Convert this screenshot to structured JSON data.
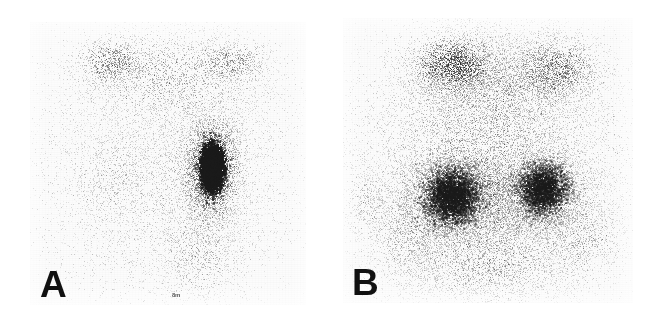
{
  "figure": {
    "kind": "scintigraphy-image-pair",
    "width": 662,
    "height": 320,
    "background_color": "#ffffff",
    "dot_color": "#1a1a1a"
  },
  "panels": [
    {
      "label": "A",
      "label_x": 40,
      "label_y": 266,
      "frame": {
        "x": 30,
        "y": 22,
        "w": 276,
        "h": 283
      },
      "base_tint": "#fcfcfc",
      "description": "Anterior scintigram with a single focal intense vertically elongated hot spot just right of midline and faint diffuse background uptake",
      "marker_text": "8m",
      "marker_x": 172,
      "marker_y": 292,
      "noise": {
        "background_count": 5200,
        "background_opacity": 0.16,
        "seed": 17
      },
      "blobs": [
        {
          "name": "focal-hot-spot-core",
          "cx": 212,
          "cy": 168,
          "rx": 16,
          "ry": 33,
          "count": 5200,
          "opacity": 0.82,
          "dot": 1.25,
          "sigma": 0.55
        },
        {
          "name": "focal-hot-spot-halo",
          "cx": 211,
          "cy": 168,
          "rx": 30,
          "ry": 54,
          "count": 2600,
          "opacity": 0.36,
          "dot": 1.1,
          "sigma": 0.75
        },
        {
          "name": "focal-hot-spot-outer",
          "cx": 211,
          "cy": 170,
          "rx": 46,
          "ry": 76,
          "count": 1500,
          "opacity": 0.18,
          "dot": 1.0,
          "sigma": 0.9
        },
        {
          "name": "upper-dome-diffuse",
          "cx": 172,
          "cy": 78,
          "rx": 92,
          "ry": 46,
          "count": 2200,
          "opacity": 0.2,
          "dot": 1.0,
          "sigma": 1.0
        },
        {
          "name": "upper-left-shoulder",
          "cx": 112,
          "cy": 62,
          "rx": 34,
          "ry": 22,
          "count": 700,
          "opacity": 0.28,
          "dot": 1.0,
          "sigma": 0.9
        },
        {
          "name": "upper-right-shoulder",
          "cx": 232,
          "cy": 62,
          "rx": 36,
          "ry": 22,
          "count": 620,
          "opacity": 0.24,
          "dot": 1.0,
          "sigma": 0.9
        },
        {
          "name": "body-soft-tissue",
          "cx": 170,
          "cy": 180,
          "rx": 110,
          "ry": 112,
          "count": 3400,
          "opacity": 0.13,
          "dot": 1.0,
          "sigma": 1.0
        },
        {
          "name": "lower-midline-trail",
          "cx": 200,
          "cy": 252,
          "rx": 40,
          "ry": 48,
          "count": 900,
          "opacity": 0.17,
          "dot": 1.0,
          "sigma": 0.95
        },
        {
          "name": "left-flank-faint",
          "cx": 110,
          "cy": 175,
          "rx": 42,
          "ry": 60,
          "count": 800,
          "opacity": 0.14,
          "dot": 1.0,
          "sigma": 1.0
        }
      ]
    },
    {
      "label": "B",
      "label_x": 352,
      "label_y": 264,
      "frame": {
        "x": 343,
        "y": 18,
        "w": 290,
        "h": 285
      },
      "base_tint": "#fcfcfc",
      "description": "Anterior scintigram with markedly increased diffuse bilateral uptake forming two broad confluent lobes in the mid-lower field",
      "marker_text": "",
      "marker_x": 0,
      "marker_y": 0,
      "noise": {
        "background_count": 6200,
        "background_opacity": 0.17,
        "seed": 53
      },
      "blobs": [
        {
          "name": "global-organ-field",
          "cx": 487,
          "cy": 165,
          "rx": 112,
          "ry": 122,
          "count": 9000,
          "opacity": 0.2,
          "dot": 1.05,
          "sigma": 1.0
        },
        {
          "name": "left-lobe-core",
          "cx": 452,
          "cy": 196,
          "rx": 34,
          "ry": 34,
          "count": 4200,
          "opacity": 0.42,
          "dot": 1.2,
          "sigma": 0.7
        },
        {
          "name": "left-lobe-halo",
          "cx": 452,
          "cy": 196,
          "rx": 56,
          "ry": 52,
          "count": 2600,
          "opacity": 0.24,
          "dot": 1.05,
          "sigma": 0.9
        },
        {
          "name": "right-lobe-core",
          "cx": 543,
          "cy": 189,
          "rx": 30,
          "ry": 32,
          "count": 3400,
          "opacity": 0.38,
          "dot": 1.18,
          "sigma": 0.7
        },
        {
          "name": "right-lobe-halo",
          "cx": 545,
          "cy": 190,
          "rx": 52,
          "ry": 50,
          "count": 2200,
          "opacity": 0.22,
          "dot": 1.05,
          "sigma": 0.9
        },
        {
          "name": "upper-left-uptake",
          "cx": 455,
          "cy": 66,
          "rx": 42,
          "ry": 30,
          "count": 2100,
          "opacity": 0.36,
          "dot": 1.1,
          "sigma": 0.85
        },
        {
          "name": "upper-right-uptake",
          "cx": 555,
          "cy": 70,
          "rx": 44,
          "ry": 32,
          "count": 1700,
          "opacity": 0.28,
          "dot": 1.08,
          "sigma": 0.9
        },
        {
          "name": "upper-band-diffuse",
          "cx": 500,
          "cy": 84,
          "rx": 86,
          "ry": 48,
          "count": 2600,
          "opacity": 0.2,
          "dot": 1.0,
          "sigma": 1.0
        },
        {
          "name": "mid-bridge",
          "cx": 497,
          "cy": 200,
          "rx": 72,
          "ry": 40,
          "count": 2000,
          "opacity": 0.2,
          "dot": 1.02,
          "sigma": 0.95
        },
        {
          "name": "lower-spill",
          "cx": 487,
          "cy": 258,
          "rx": 84,
          "ry": 48,
          "count": 2400,
          "opacity": 0.2,
          "dot": 1.02,
          "sigma": 1.0
        },
        {
          "name": "left-lower-tail",
          "cx": 410,
          "cy": 232,
          "rx": 38,
          "ry": 48,
          "count": 1100,
          "opacity": 0.2,
          "dot": 1.0,
          "sigma": 1.0
        },
        {
          "name": "right-lower-tail",
          "cx": 580,
          "cy": 236,
          "rx": 40,
          "ry": 46,
          "count": 1000,
          "opacity": 0.18,
          "dot": 1.0,
          "sigma": 1.0
        },
        {
          "name": "far-left-specks",
          "cx": 368,
          "cy": 205,
          "rx": 22,
          "ry": 36,
          "count": 400,
          "opacity": 0.16,
          "dot": 1.0,
          "sigma": 1.0
        }
      ]
    }
  ]
}
